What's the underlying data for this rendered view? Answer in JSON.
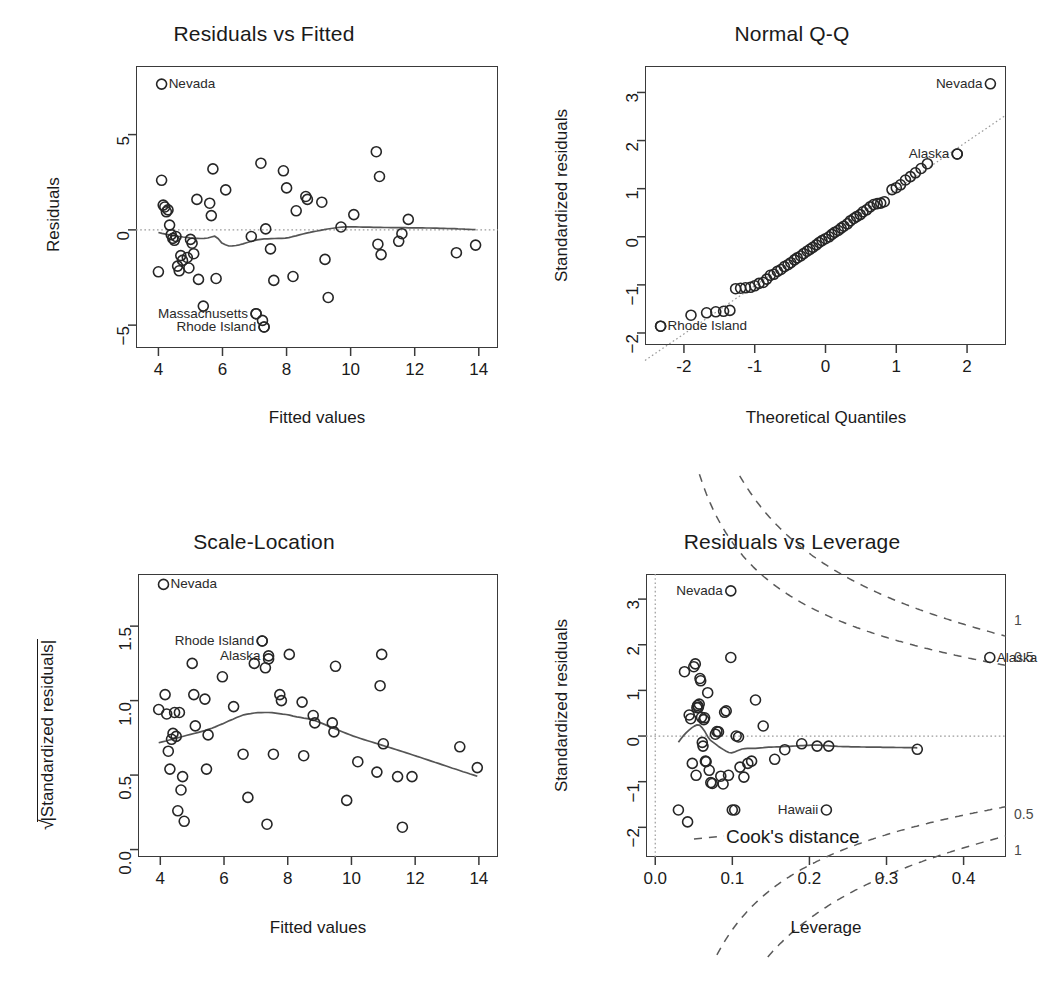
{
  "figure": {
    "kind": "r-lm-diagnostic-plots",
    "panels": [
      "Residuals vs Fitted",
      "Normal Q-Q",
      "Scale-Location",
      "Residuals vs Leverage"
    ]
  },
  "chart_data": [
    {
      "id": "residuals-vs-fitted",
      "type": "scatter",
      "title": "Residuals vs Fitted",
      "xlabel": "Fitted values",
      "ylabel": "Residuals",
      "xlim": [
        3.3,
        14.6
      ],
      "ylim": [
        -6.2,
        8.6
      ],
      "xticks": [
        4,
        6,
        8,
        10,
        12,
        14
      ],
      "yticks": [
        -5,
        0,
        5
      ],
      "grid": false,
      "reference_line": {
        "type": "horizontal-dotted",
        "y": 0
      },
      "smoother": "lowess",
      "points": [
        [
          4.0,
          -2.2
        ],
        [
          4.1,
          2.6
        ],
        [
          4.15,
          1.3
        ],
        [
          4.2,
          1.2
        ],
        [
          4.25,
          0.95
        ],
        [
          4.3,
          1.05
        ],
        [
          4.35,
          0.25
        ],
        [
          4.4,
          -0.25
        ],
        [
          4.45,
          -0.45
        ],
        [
          4.5,
          -0.55
        ],
        [
          4.55,
          -0.35
        ],
        [
          4.6,
          -1.9
        ],
        [
          4.65,
          -2.15
        ],
        [
          4.7,
          -1.35
        ],
        [
          4.75,
          -1.6
        ],
        [
          4.9,
          -1.45
        ],
        [
          4.95,
          -2.0
        ],
        [
          5.0,
          -0.5
        ],
        [
          5.05,
          -0.7
        ],
        [
          5.1,
          -1.25
        ],
        [
          5.2,
          1.6
        ],
        [
          5.25,
          -2.6
        ],
        [
          5.4,
          -4.0
        ],
        [
          5.6,
          1.4
        ],
        [
          5.65,
          0.75
        ],
        [
          5.7,
          3.2
        ],
        [
          5.8,
          -2.55
        ],
        [
          6.1,
          2.1
        ],
        [
          6.9,
          -0.35
        ],
        [
          7.05,
          -4.4
        ],
        [
          7.2,
          3.5
        ],
        [
          7.25,
          -4.75
        ],
        [
          7.3,
          -5.1
        ],
        [
          7.35,
          0.05
        ],
        [
          7.5,
          -1.0
        ],
        [
          7.6,
          -2.65
        ],
        [
          7.9,
          3.1
        ],
        [
          8.0,
          2.2
        ],
        [
          8.2,
          -2.45
        ],
        [
          8.3,
          1.0
        ],
        [
          8.6,
          1.75
        ],
        [
          8.65,
          1.6
        ],
        [
          9.1,
          1.45
        ],
        [
          9.2,
          -1.55
        ],
        [
          9.3,
          -3.55
        ],
        [
          9.7,
          0.15
        ],
        [
          10.1,
          0.8
        ],
        [
          10.8,
          4.1
        ],
        [
          10.85,
          -0.75
        ],
        [
          10.9,
          2.8
        ],
        [
          10.95,
          -1.3
        ],
        [
          11.5,
          -0.6
        ],
        [
          11.6,
          -0.2
        ],
        [
          11.8,
          0.55
        ],
        [
          13.3,
          -1.2
        ],
        [
          13.9,
          -0.8
        ]
      ],
      "labeled_points": [
        {
          "label": "Nevada",
          "x": 4.1,
          "y": 7.65,
          "anchor": "right"
        },
        {
          "label": "Massachusetts",
          "x": 7.05,
          "y": -4.4,
          "anchor": "left"
        },
        {
          "label": "Rhode Island",
          "x": 7.3,
          "y": -5.1,
          "anchor": "left"
        }
      ]
    },
    {
      "id": "normal-qq",
      "type": "scatter",
      "title": "Normal Q-Q",
      "xlabel": "Theoretical Quantiles",
      "ylabel": "Standardized residuals",
      "xlim": [
        -2.55,
        2.55
      ],
      "ylim": [
        -2.25,
        3.55
      ],
      "xticks": [
        -2,
        -1,
        0,
        1,
        2
      ],
      "yticks": [
        -2,
        -1,
        0,
        1,
        2,
        3
      ],
      "grid": false,
      "reference_line": {
        "type": "qq-diagonal-dotted"
      },
      "points": [
        [
          -2.33,
          -1.86
        ],
        [
          -1.9,
          -1.63
        ],
        [
          -1.68,
          -1.58
        ],
        [
          -1.55,
          -1.56
        ],
        [
          -1.44,
          -1.55
        ],
        [
          -1.35,
          -1.53
        ],
        [
          -1.27,
          -1.08
        ],
        [
          -1.2,
          -1.07
        ],
        [
          -1.13,
          -1.06
        ],
        [
          -1.06,
          -1.05
        ],
        [
          -1.0,
          -1.02
        ],
        [
          -0.94,
          -0.97
        ],
        [
          -0.88,
          -0.95
        ],
        [
          -0.83,
          -0.88
        ],
        [
          -0.78,
          -0.8
        ],
        [
          -0.73,
          -0.78
        ],
        [
          -0.68,
          -0.72
        ],
        [
          -0.63,
          -0.68
        ],
        [
          -0.58,
          -0.62
        ],
        [
          -0.53,
          -0.58
        ],
        [
          -0.49,
          -0.54
        ],
        [
          -0.44,
          -0.48
        ],
        [
          -0.4,
          -0.44
        ],
        [
          -0.35,
          -0.4
        ],
        [
          -0.31,
          -0.35
        ],
        [
          -0.26,
          -0.3
        ],
        [
          -0.22,
          -0.26
        ],
        [
          -0.18,
          -0.22
        ],
        [
          -0.13,
          -0.17
        ],
        [
          -0.09,
          -0.12
        ],
        [
          -0.05,
          -0.08
        ],
        [
          0.0,
          -0.04
        ],
        [
          0.05,
          0.0
        ],
        [
          0.09,
          0.05
        ],
        [
          0.13,
          0.09
        ],
        [
          0.18,
          0.13
        ],
        [
          0.22,
          0.18
        ],
        [
          0.26,
          0.22
        ],
        [
          0.31,
          0.27
        ],
        [
          0.35,
          0.33
        ],
        [
          0.4,
          0.38
        ],
        [
          0.44,
          0.42
        ],
        [
          0.49,
          0.46
        ],
        [
          0.53,
          0.52
        ],
        [
          0.58,
          0.56
        ],
        [
          0.63,
          0.62
        ],
        [
          0.68,
          0.67
        ],
        [
          0.73,
          0.69
        ],
        [
          0.78,
          0.7
        ],
        [
          0.83,
          0.73
        ],
        [
          0.94,
          0.98
        ],
        [
          1.0,
          1.02
        ],
        [
          1.06,
          1.08
        ],
        [
          1.13,
          1.18
        ],
        [
          1.2,
          1.25
        ],
        [
          1.27,
          1.33
        ],
        [
          1.35,
          1.42
        ],
        [
          1.44,
          1.52
        ],
        [
          1.86,
          1.72
        ]
      ],
      "labeled_points": [
        {
          "label": "Nevada",
          "x": 2.33,
          "y": 3.18,
          "anchor": "left"
        },
        {
          "label": "Alaska",
          "x": 1.86,
          "y": 1.72,
          "anchor": "left"
        },
        {
          "label": "Rhode Island",
          "x": -2.33,
          "y": -1.86,
          "anchor": "right"
        }
      ]
    },
    {
      "id": "scale-location",
      "type": "scatter",
      "title": "Scale-Location",
      "xlabel": "Fitted values",
      "ylabel": "sqrt(|Standardized residuals|)",
      "ylabel_display": "√|Standardized residuals|",
      "xlim": [
        3.3,
        14.6
      ],
      "ylim": [
        -0.05,
        1.85
      ],
      "xticks": [
        4,
        6,
        8,
        10,
        12,
        14
      ],
      "yticks": [
        0.0,
        0.5,
        1.0,
        1.5
      ],
      "grid": false,
      "smoother": "lowess",
      "points": [
        [
          3.95,
          0.94
        ],
        [
          4.15,
          1.04
        ],
        [
          4.2,
          0.91
        ],
        [
          4.25,
          0.66
        ],
        [
          4.3,
          0.54
        ],
        [
          4.35,
          0.74
        ],
        [
          4.4,
          0.78
        ],
        [
          4.45,
          0.92
        ],
        [
          4.5,
          0.76
        ],
        [
          4.55,
          0.26
        ],
        [
          4.6,
          0.92
        ],
        [
          4.65,
          0.4
        ],
        [
          4.7,
          0.49
        ],
        [
          4.75,
          0.19
        ],
        [
          5.0,
          1.25
        ],
        [
          5.05,
          1.04
        ],
        [
          5.1,
          0.83
        ],
        [
          5.4,
          1.01
        ],
        [
          5.45,
          0.54
        ],
        [
          5.5,
          0.77
        ],
        [
          5.95,
          1.16
        ],
        [
          6.3,
          0.96
        ],
        [
          6.75,
          0.35
        ],
        [
          6.95,
          1.25
        ],
        [
          7.2,
          1.4
        ],
        [
          7.3,
          1.22
        ],
        [
          7.35,
          0.17
        ],
        [
          7.4,
          1.28
        ],
        [
          7.75,
          1.04
        ],
        [
          7.8,
          1.0
        ],
        [
          8.05,
          1.31
        ],
        [
          8.45,
          0.99
        ],
        [
          8.5,
          0.63
        ],
        [
          8.8,
          0.9
        ],
        [
          8.85,
          0.85
        ],
        [
          9.4,
          0.85
        ],
        [
          9.45,
          0.79
        ],
        [
          9.5,
          1.23
        ],
        [
          9.85,
          0.33
        ],
        [
          10.2,
          0.59
        ],
        [
          10.8,
          0.52
        ],
        [
          10.9,
          1.1
        ],
        [
          10.95,
          1.31
        ],
        [
          11.0,
          0.71
        ],
        [
          11.45,
          0.49
        ],
        [
          11.6,
          0.15
        ],
        [
          11.9,
          0.49
        ],
        [
          13.4,
          0.69
        ],
        [
          13.95,
          0.55
        ],
        [
          6.6,
          0.64
        ],
        [
          7.55,
          0.64
        ]
      ],
      "labeled_points": [
        {
          "label": "Nevada",
          "x": 4.1,
          "y": 1.78,
          "anchor": "right"
        },
        {
          "label": "Rhode Island",
          "x": 7.2,
          "y": 1.4,
          "anchor": "left"
        },
        {
          "label": "Alaska",
          "x": 7.4,
          "y": 1.3,
          "anchor": "left"
        }
      ]
    },
    {
      "id": "residuals-vs-leverage",
      "type": "scatter",
      "title": "Residuals vs Leverage",
      "xlabel": "Leverage",
      "ylabel": "Standardized residuals",
      "xlim": [
        -0.012,
        0.455
      ],
      "ylim": [
        -2.65,
        3.55
      ],
      "xticks": [
        0.0,
        0.1,
        0.2,
        0.3,
        0.4
      ],
      "yticks": [
        -2,
        -1,
        0,
        1,
        2,
        3
      ],
      "grid": false,
      "reference_lines": [
        {
          "type": "vertical-dotted",
          "x": 0.0
        },
        {
          "type": "horizontal-dotted",
          "y": 0.0
        }
      ],
      "smoother": "lowess",
      "cooks_distance_contours": [
        0.5,
        1.0
      ],
      "cooks_legend": "Cook's distance",
      "right_axis_labels": [
        "1",
        "0.5",
        "0.5",
        "1"
      ],
      "points": [
        [
          0.03,
          -1.62
        ],
        [
          0.038,
          1.41
        ],
        [
          0.042,
          -1.88
        ],
        [
          0.044,
          0.46
        ],
        [
          0.046,
          0.38
        ],
        [
          0.048,
          -0.6
        ],
        [
          0.05,
          1.52
        ],
        [
          0.052,
          1.58
        ],
        [
          0.053,
          -0.86
        ],
        [
          0.054,
          0.62
        ],
        [
          0.055,
          0.67
        ],
        [
          0.056,
          0.63
        ],
        [
          0.057,
          0.7
        ],
        [
          0.058,
          1.26
        ],
        [
          0.059,
          1.21
        ],
        [
          0.06,
          0.41
        ],
        [
          0.061,
          -0.14
        ],
        [
          0.062,
          -0.22
        ],
        [
          0.063,
          0.36
        ],
        [
          0.064,
          0.4
        ],
        [
          0.065,
          -0.55
        ],
        [
          0.066,
          -0.56
        ],
        [
          0.068,
          0.95
        ],
        [
          0.07,
          -0.75
        ],
        [
          0.072,
          -1.02
        ],
        [
          0.074,
          -1.04
        ],
        [
          0.078,
          0.04
        ],
        [
          0.08,
          0.1
        ],
        [
          0.082,
          0.09
        ],
        [
          0.085,
          -0.88
        ],
        [
          0.088,
          -1.05
        ],
        [
          0.09,
          0.52
        ],
        [
          0.092,
          0.55
        ],
        [
          0.095,
          -0.86
        ],
        [
          0.098,
          1.72
        ],
        [
          0.1,
          -1.62
        ],
        [
          0.103,
          -1.62
        ],
        [
          0.105,
          0.0
        ],
        [
          0.108,
          -0.02
        ],
        [
          0.11,
          -0.68
        ],
        [
          0.115,
          -0.9
        ],
        [
          0.12,
          -0.6
        ],
        [
          0.125,
          -0.55
        ],
        [
          0.13,
          0.79
        ],
        [
          0.14,
          0.22
        ],
        [
          0.155,
          -0.51
        ],
        [
          0.168,
          -0.3
        ],
        [
          0.19,
          -0.17
        ],
        [
          0.21,
          -0.22
        ],
        [
          0.225,
          -0.22
        ],
        [
          0.34,
          -0.29
        ]
      ],
      "labeled_points": [
        {
          "label": "Nevada",
          "x": 0.098,
          "y": 3.18,
          "anchor": "left"
        },
        {
          "label": "Alaska",
          "x": 0.434,
          "y": 1.72,
          "anchor": "right"
        },
        {
          "label": "Hawaii",
          "x": 0.222,
          "y": -1.62,
          "anchor": "left"
        }
      ]
    }
  ]
}
